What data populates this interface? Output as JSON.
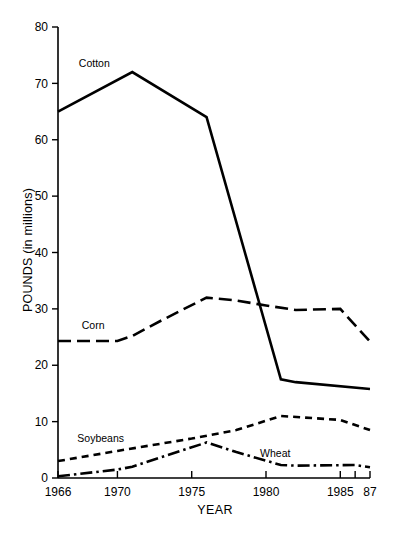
{
  "chart_data": {
    "type": "line",
    "title": "",
    "xlabel": "YEAR",
    "ylabel": "POUNDS (in millions)",
    "xlim": [
      1966,
      1987
    ],
    "ylim": [
      0,
      80
    ],
    "grid": false,
    "legend_position": "inline-labels",
    "x_tick_labels": [
      "1966",
      "1970",
      "1975",
      "1980",
      "1985",
      "87"
    ],
    "x_tick_values": [
      1966,
      1970,
      1975,
      1980,
      1985,
      1987
    ],
    "x_minor_tick_values": [
      1986
    ],
    "y_tick_labels": [
      "0",
      "10",
      "20",
      "30",
      "40",
      "50",
      "60",
      "70",
      "80"
    ],
    "y_tick_values": [
      0,
      10,
      20,
      30,
      40,
      50,
      60,
      70,
      80
    ],
    "series": [
      {
        "name": "Cotton",
        "style": "solid",
        "label_x": 1967.4,
        "label_y": 73.5,
        "x": [
          1966,
          1971,
          1976,
          1981,
          1982,
          1987
        ],
        "values": [
          65.0,
          72.0,
          64.0,
          17.5,
          17.0,
          15.8
        ]
      },
      {
        "name": "Corn",
        "style": "long-dash",
        "label_x": 1967.6,
        "label_y": 27.0,
        "x": [
          1966,
          1970,
          1971,
          1973,
          1976,
          1978,
          1980,
          1982,
          1985,
          1987
        ],
        "values": [
          24.3,
          24.3,
          25.2,
          28.0,
          32.0,
          31.5,
          30.6,
          29.8,
          30.0,
          24.2
        ]
      },
      {
        "name": "Soybeans",
        "style": "short-dash",
        "label_x": 1967.3,
        "label_y": 7.0,
        "x": [
          1966,
          1970,
          1975,
          1978,
          1981,
          1985,
          1987
        ],
        "values": [
          3.0,
          4.8,
          7.0,
          8.5,
          11.0,
          10.3,
          8.5
        ]
      },
      {
        "name": "Wheat",
        "style": "dash-dot",
        "label_x": 1979.6,
        "label_y": 4.3,
        "x": [
          1966,
          1970,
          1971,
          1976,
          1978,
          1981,
          1982,
          1986,
          1987
        ],
        "values": [
          0.3,
          1.5,
          2.0,
          6.3,
          4.6,
          2.3,
          2.2,
          2.3,
          1.9
        ]
      }
    ]
  }
}
